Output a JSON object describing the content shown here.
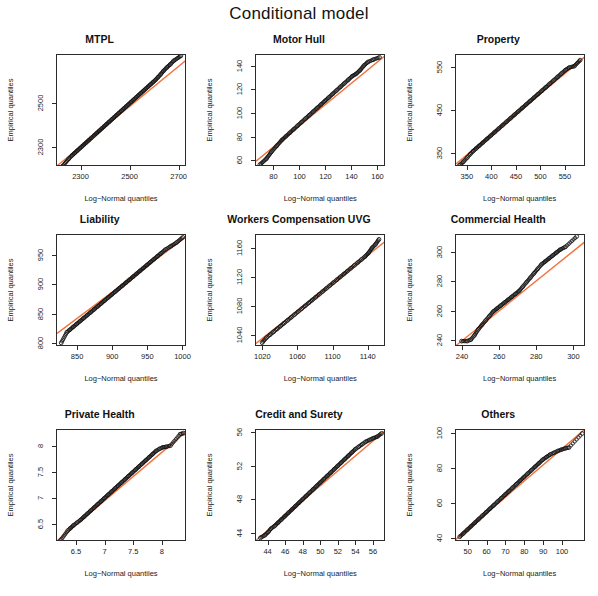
{
  "figure": {
    "main_title": "Conditional model",
    "xlabel": "Log−Normal quantiles",
    "ylabel": "Empirical quantiles",
    "point_color": "#111111",
    "line_color": "#f2703a",
    "box_color": "#2b2b2b",
    "background": "#ffffff",
    "rows": 3,
    "cols": 3
  },
  "chart_data": [
    {
      "type": "scatter",
      "title": "MTPL",
      "xlabel": "Log−Normal quantiles",
      "ylabel": "Empirical quantiles",
      "xlim": [
        2200,
        2730
      ],
      "ylim": [
        2215,
        2720
      ],
      "xticks": [
        2300,
        2500,
        2700
      ],
      "yticks": [
        2300,
        2500
      ],
      "ref_line": {
        "x0": 2200,
        "y0": 2220,
        "x1": 2730,
        "y1": 2700
      },
      "points_x": [
        2222,
        2248,
        2262,
        2272,
        2282,
        2292,
        2300,
        2310,
        2320,
        2330,
        2340,
        2352,
        2362,
        2372,
        2382,
        2392,
        2402,
        2412,
        2422,
        2432,
        2442,
        2452,
        2462,
        2472,
        2482,
        2492,
        2502,
        2512,
        2522,
        2532,
        2542,
        2552,
        2562,
        2572,
        2582,
        2592,
        2602,
        2612,
        2622,
        2634,
        2648,
        2662,
        2676,
        2705
      ],
      "points_y": [
        2218,
        2252,
        2268,
        2278,
        2288,
        2298,
        2306,
        2316,
        2326,
        2336,
        2346,
        2358,
        2368,
        2378,
        2388,
        2398,
        2408,
        2418,
        2428,
        2438,
        2448,
        2458,
        2468,
        2478,
        2488,
        2498,
        2508,
        2518,
        2528,
        2538,
        2548,
        2558,
        2568,
        2578,
        2588,
        2598,
        2608,
        2620,
        2632,
        2648,
        2664,
        2678,
        2694,
        2716
      ]
    },
    {
      "type": "scatter",
      "title": "Motor Hull",
      "xlabel": "Log−Normal quantiles",
      "ylabel": "Empirical quantiles",
      "xlim": [
        66,
        166
      ],
      "ylim": [
        55,
        150
      ],
      "xticks": [
        80,
        100,
        120,
        140,
        160
      ],
      "yticks": [
        60,
        80,
        100,
        120,
        140
      ],
      "ref_line": {
        "x0": 66,
        "y0": 60,
        "x1": 166,
        "y1": 150
      },
      "points_x": [
        69,
        74,
        78,
        82,
        86,
        89,
        92,
        95,
        98,
        101,
        104,
        107,
        110,
        113,
        116,
        119,
        122,
        125,
        128,
        131,
        134,
        137,
        140,
        143,
        146,
        149,
        152,
        156,
        161
      ],
      "points_y": [
        57,
        62,
        68,
        73,
        78,
        81,
        84,
        87,
        90,
        93,
        96,
        99,
        102,
        105,
        108,
        111,
        114,
        117,
        120,
        123,
        126,
        129,
        132,
        134,
        137,
        141,
        144,
        146,
        148
      ]
    },
    {
      "type": "scatter",
      "title": "Property",
      "xlabel": "Log−Normal quantiles",
      "ylabel": "Empirical quantiles",
      "xlim": [
        325,
        590
      ],
      "ylim": [
        320,
        580
      ],
      "xticks": [
        350,
        400,
        450,
        500,
        550
      ],
      "yticks": [
        350,
        450,
        550
      ],
      "ref_line": {
        "x0": 325,
        "y0": 327,
        "x1": 590,
        "y1": 578
      },
      "points_x": [
        332,
        340,
        348,
        354,
        360,
        366,
        372,
        380,
        388,
        396,
        404,
        412,
        420,
        428,
        436,
        444,
        452,
        460,
        468,
        476,
        484,
        492,
        500,
        508,
        516,
        524,
        532,
        540,
        548,
        556,
        566,
        578
      ],
      "points_y": [
        324,
        332,
        342,
        350,
        357,
        363,
        369,
        377,
        385,
        393,
        401,
        409,
        417,
        425,
        433,
        441,
        449,
        457,
        465,
        473,
        481,
        489,
        497,
        505,
        513,
        521,
        529,
        537,
        545,
        551,
        554,
        568
      ]
    },
    {
      "type": "scatter",
      "title": "Liability",
      "xlabel": "Log−Normal quantiles",
      "ylabel": "Empirical quantiles",
      "xlim": [
        820,
        1005
      ],
      "ylim": [
        795,
        985
      ],
      "xticks": [
        850,
        900,
        950,
        1000
      ],
      "yticks": [
        800,
        850,
        900,
        950
      ],
      "ref_line": {
        "x0": 820,
        "y0": 818,
        "x1": 1005,
        "y1": 983
      },
      "points_x": [
        826,
        834,
        838,
        843,
        848,
        853,
        858,
        863,
        868,
        873,
        878,
        883,
        888,
        893,
        898,
        903,
        908,
        913,
        918,
        923,
        928,
        933,
        938,
        943,
        948,
        953,
        958,
        963,
        968,
        974,
        982,
        990,
        999
      ],
      "points_y": [
        802,
        820,
        824,
        829,
        834,
        839,
        844,
        849,
        854,
        859,
        864,
        869,
        874,
        879,
        884,
        889,
        894,
        899,
        904,
        909,
        914,
        919,
        924,
        929,
        934,
        939,
        944,
        949,
        954,
        960,
        966,
        972,
        981
      ]
    },
    {
      "type": "scatter",
      "title": "Workers Compensation UVG",
      "xlabel": "Log−Normal quantiles",
      "ylabel": "Empirical quantiles",
      "xlim": [
        1012,
        1160
      ],
      "ylim": [
        1025,
        1180
      ],
      "xticks": [
        1020,
        1060,
        1100,
        1140
      ],
      "yticks": [
        1040,
        1080,
        1120,
        1160
      ],
      "ref_line": {
        "x0": 1012,
        "y0": 1030,
        "x1": 1160,
        "y1": 1172
      },
      "points_x": [
        1019,
        1024,
        1028,
        1032,
        1036,
        1040,
        1044,
        1048,
        1052,
        1056,
        1060,
        1064,
        1068,
        1072,
        1076,
        1080,
        1084,
        1088,
        1092,
        1096,
        1100,
        1104,
        1108,
        1112,
        1116,
        1120,
        1124,
        1128,
        1132,
        1136,
        1140,
        1144,
        1148,
        1152
      ],
      "points_y": [
        1031,
        1038,
        1042,
        1046,
        1050,
        1054,
        1058,
        1062,
        1066,
        1070,
        1074,
        1078,
        1082,
        1086,
        1090,
        1094,
        1098,
        1102,
        1106,
        1110,
        1114,
        1118,
        1122,
        1126,
        1130,
        1134,
        1138,
        1142,
        1146,
        1150,
        1155,
        1162,
        1167,
        1174
      ]
    },
    {
      "type": "scatter",
      "title": "Commercial Health",
      "xlabel": "Log−Normal quantiles",
      "ylabel": "Empirical quantiles",
      "xlim": [
        236,
        306
      ],
      "ylim": [
        236,
        312
      ],
      "xticks": [
        240,
        260,
        280,
        300
      ],
      "yticks": [
        240,
        260,
        280,
        300
      ],
      "ref_line": {
        "x0": 236,
        "y0": 237,
        "x1": 306,
        "y1": 308
      },
      "points_x": [
        239,
        242,
        244,
        246,
        248,
        250,
        252,
        254,
        256,
        258,
        260,
        262,
        264,
        266,
        268,
        270,
        272,
        274,
        276,
        278,
        280,
        282,
        284,
        286,
        288,
        290,
        292,
        295,
        301
      ],
      "points_y": [
        240,
        240,
        241,
        244,
        248,
        251,
        254,
        257,
        260,
        262,
        264,
        266,
        268,
        270,
        272,
        274,
        277,
        280,
        283,
        286,
        289,
        292,
        294,
        296,
        298,
        300,
        302,
        304,
        311
      ]
    },
    {
      "type": "scatter",
      "title": "Private Health",
      "xlabel": "Log−Normal quantiles",
      "ylabel": "Empirical quantiles",
      "xlim": [
        6.15,
        8.42
      ],
      "ylim": [
        6.18,
        8.32
      ],
      "xticks": [
        6.5,
        7.0,
        7.5,
        8.0
      ],
      "yticks": [
        6.5,
        7.0,
        7.5,
        8.0
      ],
      "ref_line": {
        "x0": 6.15,
        "y0": 6.2,
        "x1": 8.42,
        "y1": 8.3
      },
      "points_x": [
        6.21,
        6.34,
        6.38,
        6.44,
        6.5,
        6.56,
        6.62,
        6.68,
        6.74,
        6.8,
        6.86,
        6.92,
        6.98,
        7.04,
        7.1,
        7.16,
        7.22,
        7.28,
        7.34,
        7.4,
        7.46,
        7.52,
        7.58,
        7.64,
        7.7,
        7.76,
        7.82,
        7.88,
        7.94,
        8.0,
        8.06,
        8.13,
        8.3,
        8.36
      ],
      "points_y": [
        6.21,
        6.4,
        6.44,
        6.5,
        6.55,
        6.6,
        6.66,
        6.72,
        6.78,
        6.84,
        6.9,
        6.96,
        7.02,
        7.08,
        7.14,
        7.2,
        7.26,
        7.32,
        7.38,
        7.44,
        7.5,
        7.56,
        7.62,
        7.68,
        7.74,
        7.8,
        7.86,
        7.92,
        7.96,
        7.99,
        8.0,
        8.02,
        8.24,
        8.26
      ]
    },
    {
      "type": "scatter",
      "title": "Credit and Surety",
      "xlabel": "Log−Normal quantiles",
      "ylabel": "Empirical quantiles",
      "xlim": [
        42.6,
        57.4
      ],
      "ylim": [
        43.0,
        56.4
      ],
      "xticks": [
        44,
        46,
        48,
        50,
        52,
        54,
        56
      ],
      "yticks": [
        44,
        48,
        52,
        56
      ],
      "ref_line": {
        "x0": 42.6,
        "y0": 43.2,
        "x1": 57.4,
        "y1": 56.4
      },
      "points_x": [
        43.1,
        43.6,
        44.0,
        44.3,
        44.7,
        45.1,
        45.5,
        45.9,
        46.3,
        46.7,
        47.1,
        47.5,
        47.9,
        48.3,
        48.7,
        49.1,
        49.5,
        49.9,
        50.3,
        50.7,
        51.1,
        51.5,
        51.9,
        52.3,
        52.7,
        53.1,
        53.5,
        53.9,
        54.3,
        54.7,
        55.1,
        55.5,
        55.9,
        56.4,
        56.9
      ],
      "points_y": [
        43.5,
        43.8,
        44.2,
        44.6,
        44.9,
        45.3,
        45.7,
        46.1,
        46.5,
        46.9,
        47.3,
        47.7,
        48.1,
        48.5,
        48.9,
        49.3,
        49.7,
        50.1,
        50.5,
        50.9,
        51.3,
        51.7,
        52.1,
        52.5,
        52.9,
        53.3,
        53.7,
        54.1,
        54.4,
        54.7,
        55.0,
        55.2,
        55.4,
        55.6,
        56.0
      ]
    },
    {
      "type": "scatter",
      "title": "Others",
      "xlabel": "Log−Normal quantiles",
      "ylabel": "Empirical quantiles",
      "xlim": [
        43,
        112
      ],
      "ylim": [
        38,
        102
      ],
      "xticks": [
        50,
        60,
        70,
        80,
        90,
        100
      ],
      "yticks": [
        40,
        60,
        80,
        100
      ],
      "ref_line": {
        "x0": 43,
        "y0": 39.5,
        "x1": 112,
        "y1": 103
      },
      "points_x": [
        45,
        47,
        49,
        51,
        53,
        55,
        57,
        59,
        61,
        63,
        65,
        67,
        69,
        71,
        73,
        75,
        77,
        79,
        81,
        83,
        85,
        87,
        89,
        91,
        93,
        95,
        97,
        99,
        101,
        103,
        110
      ],
      "points_y": [
        41,
        43,
        45,
        47,
        49,
        51,
        53,
        55,
        57,
        59,
        61,
        63,
        65,
        67,
        69,
        71,
        73,
        75,
        77,
        79,
        81,
        83,
        85,
        86.5,
        88,
        89,
        90,
        90.8,
        91.5,
        92,
        100
      ]
    }
  ]
}
